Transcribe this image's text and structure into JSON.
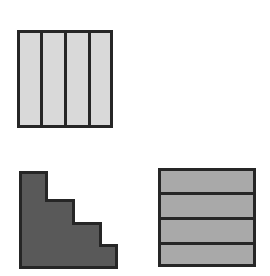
{
  "page": {
    "background_color": "#ffffff",
    "width": 270,
    "height": 276
  },
  "palette": {
    "light_gray_fill": "#d9d9d9",
    "medium_gray_fill": "#a9a9a9",
    "dark_gray_fill": "#595959",
    "outline_color": "#262626",
    "divider_color": "#262626",
    "background": "#ffffff"
  },
  "shapes": [
    {
      "id": "vertical-strip-square",
      "name": "Square divided into four vertical strips",
      "position": "top-left",
      "type": "rectangle",
      "fill": "#d9d9d9",
      "stroke": "#262626",
      "stroke_width": 3,
      "x": 17,
      "y": 30,
      "width": 96,
      "height": 98,
      "partition_direction": "vertical",
      "partition_count": 4,
      "divider_positions": [
        41,
        65,
        89
      ],
      "divider_width": 3
    },
    {
      "id": "staircase-polygon",
      "name": "Three-step descending staircase polygon",
      "position": "bottom-left",
      "type": "polygon",
      "fill": "#595959",
      "stroke": "#262626",
      "stroke_width": 3,
      "step_count": 3,
      "points": "20,172 46,172 46,200 73,200 73,223 100,223 100,245 116,245 116,267 20,267",
      "bounds": {
        "x": 20,
        "y": 172,
        "width": 96,
        "height": 95
      }
    },
    {
      "id": "horizontal-band-square",
      "name": "Square divided into four horizontal bands",
      "position": "bottom-right",
      "type": "rectangle",
      "fill": "#a9a9a9",
      "stroke": "#262626",
      "stroke_width": 3,
      "x": 158,
      "y": 168,
      "width": 98,
      "height": 99,
      "partition_direction": "horizontal",
      "partition_count": 4,
      "divider_positions": [
        193,
        218,
        243
      ],
      "divider_width": 3
    }
  ],
  "accessibility": {
    "figure_description": "Three gray geometric figures on a white background: a light gray square split into four equal vertical strips at the top left, a dark gray three-step staircase shape at the bottom left, and a medium gray square split into four equal horizontal bands at the bottom right."
  }
}
